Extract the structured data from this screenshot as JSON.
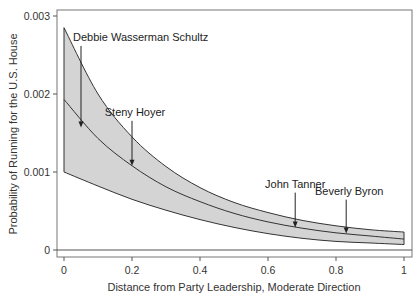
{
  "chart_data": {
    "type": "line",
    "title": "",
    "xlabel": "Distance from Party Leadership, Moderate Direction",
    "ylabel": "Probability of Running for the U.S. House",
    "xlim": [
      0,
      1
    ],
    "ylim": [
      0,
      0.003
    ],
    "x_ticks": [
      0,
      0.2,
      0.4,
      0.6,
      0.8,
      1
    ],
    "x_tick_labels": [
      "0",
      "0.2",
      "0.4",
      "0.6",
      "0.8",
      "1"
    ],
    "y_ticks": [
      0,
      0.001,
      0.002,
      0.003
    ],
    "y_tick_labels": [
      "0",
      "0.001",
      "0.002",
      "0.003"
    ],
    "grid": false,
    "legend": null,
    "x": [
      0,
      0.1,
      0.2,
      0.3,
      0.4,
      0.5,
      0.6,
      0.7,
      0.8,
      0.9,
      1.0
    ],
    "series": [
      {
        "name": "Upper bound",
        "style": "band-edge",
        "values": [
          0.00285,
          0.002,
          0.00145,
          0.00107,
          0.0008,
          0.00061,
          0.00048,
          0.00038,
          0.00031,
          0.00026,
          0.00023
        ]
      },
      {
        "name": "Predicted probability",
        "style": "solid",
        "values": [
          0.00193,
          0.00143,
          0.00108,
          0.00081,
          0.00062,
          0.00047,
          0.00036,
          0.00028,
          0.00022,
          0.00018,
          0.00014
        ]
      },
      {
        "name": "Lower bound",
        "style": "band-edge",
        "values": [
          0.001,
          0.00082,
          0.00065,
          0.00051,
          0.00039,
          0.00029,
          0.00021,
          0.00015,
          0.00011,
          9e-05,
          7e-05
        ]
      }
    ],
    "band": {
      "between": [
        "Lower bound",
        "Upper bound"
      ],
      "fill": "#d4d4d4"
    },
    "annotations": [
      {
        "label": "Debbie Wasserman Schultz",
        "x": 0.05,
        "text_y": 0.00268,
        "arrow_to_y": 0.00157
      },
      {
        "label": "Steny Hoyer",
        "x": 0.2,
        "text_y": 0.00172,
        "arrow_to_y": 0.00108
      },
      {
        "label": "John Tanner",
        "x": 0.68,
        "text_y": 0.0008,
        "arrow_to_y": 0.00029
      },
      {
        "label": "Beverly Byron",
        "x": 0.83,
        "text_y": 0.00071,
        "arrow_to_y": 0.00021
      }
    ],
    "colors": {
      "band": "#d4d4d4",
      "line": "#333333",
      "axis": "#555555"
    }
  }
}
